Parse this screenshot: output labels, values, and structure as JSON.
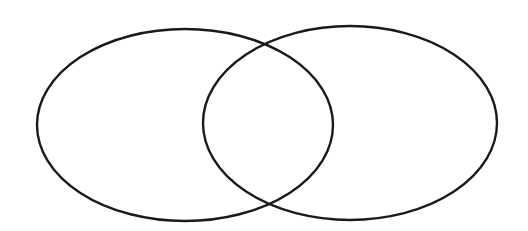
{
  "diagram": {
    "type": "venn",
    "background": "#ffffff",
    "stroke_color": "#1a1a1a",
    "stroke_width": 2.4,
    "sets": [
      {
        "id": "left",
        "label": "",
        "cx": 185,
        "cy": 125,
        "rx": 148,
        "ry": 96
      },
      {
        "id": "right",
        "label": "",
        "cx": 350,
        "cy": 123,
        "rx": 147,
        "ry": 97
      }
    ],
    "regions": {
      "left_only": "",
      "intersection": "",
      "right_only": ""
    }
  }
}
